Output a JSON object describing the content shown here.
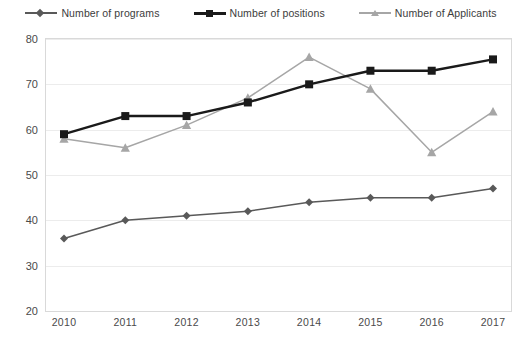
{
  "chart_data": {
    "type": "line",
    "title": "",
    "xlabel": "",
    "ylabel": "",
    "x": [
      "2010",
      "2011",
      "2012",
      "2013",
      "2014",
      "2015",
      "2016",
      "2017"
    ],
    "categories": [
      "2010",
      "2011",
      "2012",
      "2013",
      "2014",
      "2015",
      "2016",
      "2017"
    ],
    "ylim": [
      20,
      80
    ],
    "yticks": [
      "20",
      "30",
      "40",
      "50",
      "60",
      "70",
      "80"
    ],
    "grid": true,
    "legend_position": "top",
    "series": [
      {
        "name": "Number of programs",
        "marker": "diamond",
        "color": "#595959",
        "values": [
          36,
          40,
          41,
          42,
          44,
          45,
          45,
          47
        ]
      },
      {
        "name": "Number of positions",
        "marker": "square",
        "color": "#1a1a1a",
        "values": [
          59,
          63,
          63,
          66,
          70,
          73,
          73,
          75.5
        ]
      },
      {
        "name": "Number of Applicants",
        "marker": "triangle",
        "color": "#a6a6a6",
        "values": [
          58,
          56,
          61,
          67,
          76,
          69,
          55,
          64
        ]
      }
    ]
  },
  "legend": {
    "items": [
      {
        "label": "Number of programs"
      },
      {
        "label": "Number of positions"
      },
      {
        "label": "Number of Applicants"
      }
    ]
  },
  "axes": {
    "y_ticks": [
      "80",
      "70",
      "60",
      "50",
      "40",
      "30",
      "20"
    ],
    "x_ticks": [
      "2010",
      "2011",
      "2012",
      "2013",
      "2014",
      "2015",
      "2016",
      "2017"
    ]
  },
  "colors": {
    "programs": "#595959",
    "positions": "#1a1a1a",
    "applicants": "#a6a6a6",
    "grid": "#ececec",
    "frame": "#d9d9d9",
    "text": "#4a4a4a"
  }
}
